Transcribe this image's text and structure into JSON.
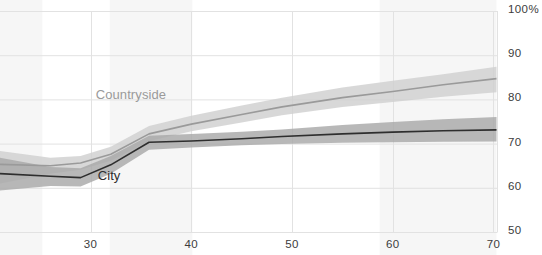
{
  "chart_data": {
    "type": "line",
    "title": "",
    "xlabel": "",
    "ylabel": "",
    "xlim": [
      21.0,
      70.4
    ],
    "ylim": [
      50,
      100
    ],
    "grid": true,
    "grid_axes": "both",
    "legend": "inline-annotations",
    "y_ticks": [
      50,
      60,
      70,
      80,
      90,
      100
    ],
    "y_tick_labels": [
      "50",
      "60",
      "70",
      "80",
      "90",
      "100%"
    ],
    "x_ticks": [
      30,
      40,
      50,
      60,
      70
    ],
    "x_tick_labels": [
      "30",
      "40",
      "50",
      "60",
      "70"
    ],
    "series": [
      {
        "name": "Countryside",
        "color": "#9a9a9a",
        "band_color": "#cfcfcf",
        "label_color": "#9a9a9a",
        "x": [
          21.0,
          26.0,
          29.0,
          32.0,
          35.8,
          40.0,
          45.0,
          49.0,
          55.0,
          60.0,
          65.0,
          70.3
        ],
        "values": [
          65.3,
          65.0,
          65.6,
          67.6,
          72.2,
          74.4,
          76.6,
          78.3,
          80.4,
          81.8,
          83.3,
          84.7
        ],
        "band_low": [
          61.0,
          63.2,
          64.1,
          66.1,
          70.6,
          72.8,
          74.8,
          76.4,
          78.3,
          79.4,
          80.6,
          81.6
        ],
        "band_high": [
          68.3,
          66.8,
          67.2,
          69.3,
          74.0,
          76.3,
          78.6,
          80.4,
          82.7,
          84.2,
          85.7,
          87.4
        ]
      },
      {
        "name": "City",
        "color": "#2e2e2e",
        "band_color": "#a8a8a8",
        "label_color": "#2e2e2e",
        "x": [
          21.0,
          26.0,
          29.0,
          32.0,
          35.8,
          40.0,
          45.0,
          49.0,
          55.0,
          60.0,
          65.0,
          70.3
        ],
        "values": [
          63.2,
          62.6,
          62.3,
          65.2,
          70.3,
          70.6,
          71.1,
          71.6,
          72.2,
          72.6,
          72.9,
          73.1
        ],
        "band_low": [
          59.4,
          60.4,
          60.3,
          63.2,
          68.6,
          69.1,
          69.6,
          69.9,
          70.2,
          70.3,
          70.4,
          70.5
        ],
        "band_high": [
          66.8,
          64.7,
          64.4,
          67.2,
          71.8,
          72.2,
          72.7,
          73.2,
          74.2,
          74.9,
          75.5,
          76.0
        ]
      }
    ],
    "shaded_x_regions": [
      {
        "start": 21.0,
        "end": 25.2
      },
      {
        "start": 31.9,
        "end": 40.1
      },
      {
        "start": 58.7,
        "end": 70.3
      }
    ],
    "annotations": [
      {
        "text": "Countryside",
        "x": 30.5,
        "y": 80.9,
        "color": "#9a9a9a"
      },
      {
        "text": "City",
        "x": 30.7,
        "y": 62.6,
        "color": "#2e2e2e"
      }
    ]
  },
  "colors": {
    "background": "#ffffff",
    "gridline": "#e2e2e2",
    "axis_text": "#3c3c3c",
    "shaded_region": "#f6f6f6",
    "countryside_line": "#9a9a9a",
    "countryside_band": "#cfcfcf",
    "city_line": "#2e2e2e",
    "city_band": "#a8a8a8"
  },
  "y_axis": {
    "ticks": [
      {
        "label": "100%",
        "value": 100
      },
      {
        "label": "90",
        "value": 90
      },
      {
        "label": "80",
        "value": 80
      },
      {
        "label": "70",
        "value": 70
      },
      {
        "label": "60",
        "value": 60
      },
      {
        "label": "50",
        "value": 50
      }
    ]
  },
  "x_axis": {
    "ticks": [
      {
        "label": "30",
        "value": 30
      },
      {
        "label": "40",
        "value": 40
      },
      {
        "label": "50",
        "value": 50
      },
      {
        "label": "60",
        "value": 60
      },
      {
        "label": "70",
        "value": 70
      }
    ]
  },
  "labels": {
    "countryside": "Countryside",
    "city": "City"
  }
}
